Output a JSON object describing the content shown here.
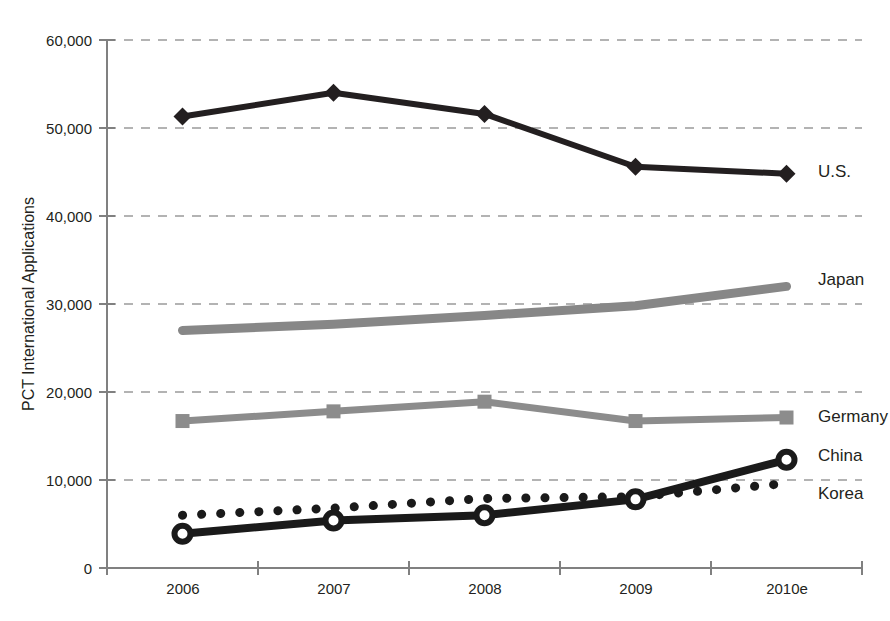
{
  "chart_data": {
    "type": "line",
    "title": "",
    "xlabel": "",
    "ylabel": "PCT International Applications",
    "categories": [
      "2006",
      "2007",
      "2008",
      "2009",
      "2010e"
    ],
    "ylim": [
      0,
      60000
    ],
    "yticks": [
      "0",
      "10,000",
      "20,000",
      "30,000",
      "40,000",
      "50,000",
      "60,000"
    ],
    "ytick_values": [
      0,
      10000,
      20000,
      30000,
      40000,
      50000,
      60000
    ],
    "grid": true,
    "legend_position": "right-of-lines",
    "series": [
      {
        "name": "U.S.",
        "label": "U.S.",
        "color": "#231f20",
        "marker": "diamond",
        "style": "solid",
        "width": 6,
        "values": [
          51300,
          54000,
          51600,
          45600,
          44800
        ]
      },
      {
        "name": "Japan",
        "label": "Japan",
        "color": "#878787",
        "marker": "none",
        "style": "solid",
        "width": 9,
        "values": [
          27000,
          27700,
          28700,
          29800,
          32000
        ]
      },
      {
        "name": "Germany",
        "label": "Germany",
        "color": "#8c8c8c",
        "marker": "square",
        "style": "solid",
        "width": 7,
        "values": [
          16700,
          17800,
          18900,
          16700,
          17100
        ]
      },
      {
        "name": "China",
        "label": "China",
        "color": "#1a1a1a",
        "marker": "open-circle",
        "style": "solid",
        "width": 7,
        "values": [
          3900,
          5400,
          6000,
          7800,
          12300
        ]
      },
      {
        "name": "Korea",
        "label": "Korea",
        "color": "#1a1a1a",
        "marker": "none",
        "style": "dotted",
        "width": 9,
        "values": [
          6000,
          6800,
          7900,
          8100,
          9600
        ]
      }
    ]
  },
  "labels": {
    "us": "U.S.",
    "japan": "Japan",
    "germany": "Germany",
    "china": "China",
    "korea": "Korea",
    "y_axis_title": "PCT International Applications",
    "y_0": "0",
    "y_10000": "10,000",
    "y_20000": "20,000",
    "y_30000": "30,000",
    "y_40000": "40,000",
    "y_50000": "50,000",
    "y_60000": "60,000",
    "x_2006": "2006",
    "x_2007": "2007",
    "x_2008": "2008",
    "x_2009": "2009",
    "x_2010e": "2010e"
  }
}
